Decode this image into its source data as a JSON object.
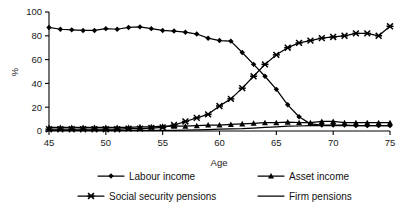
{
  "chart_data": {
    "type": "line",
    "title": "",
    "xlabel": "Age",
    "ylabel": "%",
    "xlim": [
      45,
      75
    ],
    "ylim": [
      0,
      100
    ],
    "xticks": [
      45,
      50,
      55,
      60,
      65,
      70,
      75
    ],
    "yticks": [
      0,
      20,
      40,
      60,
      80,
      100
    ],
    "grid": false,
    "legend_position": "bottom",
    "x": [
      45,
      46,
      47,
      48,
      49,
      50,
      51,
      52,
      53,
      54,
      55,
      56,
      57,
      58,
      59,
      60,
      61,
      62,
      63,
      64,
      65,
      66,
      67,
      68,
      69,
      70,
      71,
      72,
      73,
      74,
      75
    ],
    "series": [
      {
        "name": "Labour income",
        "marker": "diamond",
        "values": [
          87,
          85.5,
          85,
          84.5,
          84.5,
          86,
          85.5,
          87,
          87.5,
          86,
          84.5,
          84,
          83,
          81.5,
          78,
          76,
          75.5,
          66,
          56,
          46,
          35,
          22,
          12,
          6,
          5,
          5,
          5,
          4.5,
          4.5,
          4.5,
          4.5
        ]
      },
      {
        "name": "Asset income",
        "marker": "triangle",
        "values": [
          3,
          3,
          3,
          3,
          3,
          3,
          3,
          3,
          3.5,
          3.5,
          4,
          4,
          4,
          4.5,
          5,
          5,
          5.5,
          6,
          6.5,
          7,
          7,
          7.5,
          7,
          7,
          8,
          8,
          7,
          7,
          7,
          7,
          7
        ]
      },
      {
        "name": "Social security pensions",
        "marker": "x",
        "values": [
          1.5,
          1.5,
          1.5,
          1.5,
          1.5,
          1.5,
          1.5,
          2,
          2,
          2.5,
          3,
          5,
          8,
          11,
          14,
          21,
          27,
          36,
          46,
          56,
          64,
          70,
          74,
          76,
          78,
          79,
          80,
          82,
          82,
          80,
          88
        ]
      },
      {
        "name": "Firm pensions",
        "marker": "none",
        "values": [
          0.5,
          0.5,
          0.5,
          0.5,
          0.5,
          0.5,
          0.5,
          0.5,
          0.5,
          0.5,
          0.5,
          0.5,
          0.8,
          1,
          1.2,
          1.5,
          1.8,
          2,
          2.5,
          3,
          3.5,
          4,
          4.2,
          4.5,
          4.5,
          4.5,
          4.5,
          4.5,
          4.5,
          4.5,
          4.5
        ]
      }
    ]
  },
  "legend": {
    "items": [
      {
        "label": "Labour income",
        "marker": "diamond"
      },
      {
        "label": "Asset income",
        "marker": "triangle"
      },
      {
        "label": "Social security pensions",
        "marker": "x"
      },
      {
        "label": "Firm pensions",
        "marker": "none"
      }
    ]
  }
}
